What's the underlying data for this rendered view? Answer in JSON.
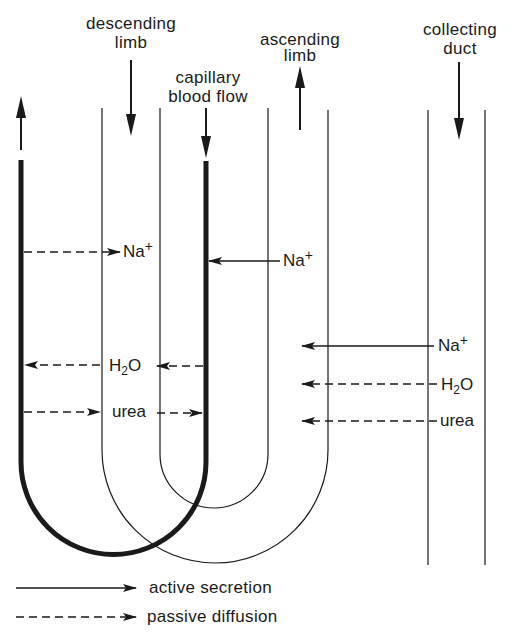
{
  "diagram": {
    "title_labels": {
      "descending_limb": [
        "descending",
        "limb"
      ],
      "capillary": [
        "capillary",
        "blood flow"
      ],
      "ascending_limb": [
        "ascending",
        "limb"
      ],
      "collecting_duct": [
        "collecting",
        "duct"
      ]
    },
    "exchanges": {
      "capillary_descending": [
        {
          "substance": "Na",
          "superscript": "+",
          "type": "passive diffusion",
          "direction": "capillary to descending limb"
        },
        {
          "substance": "H",
          "subscript": "2",
          "suffix": "O",
          "type": "passive diffusion",
          "direction": "into capillary (both sides)"
        },
        {
          "substance": "urea",
          "type": "passive diffusion",
          "direction": "outward (both sides)"
        }
      ],
      "ascending_to_capillary": [
        {
          "substance": "Na",
          "superscript": "+",
          "type": "active secretion",
          "direction": "leftward into capillary"
        }
      ],
      "collecting_duct": [
        {
          "substance": "Na",
          "superscript": "+",
          "type": "active secretion",
          "direction": "leftward"
        },
        {
          "substance": "H",
          "subscript": "2",
          "suffix": "O",
          "type": "passive diffusion",
          "direction": "leftward"
        },
        {
          "substance": "urea",
          "type": "passive diffusion",
          "direction": "leftward"
        }
      ]
    },
    "ions": {
      "na_label": "Na",
      "plus": "+",
      "h_label": "H",
      "two": "2",
      "o_label": "O",
      "urea_label": "urea"
    },
    "legend": {
      "active": "active secretion",
      "passive": "passive diffusion"
    },
    "colors": {
      "ink": "#1a1a1a",
      "background": "#ffffff"
    }
  }
}
